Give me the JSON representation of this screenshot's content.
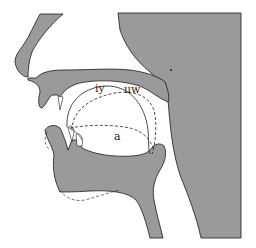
{
  "figure": {
    "colors": {
      "tissue_fill": "#9a9a9a",
      "outline": "#1a1a1a",
      "background": "#ffffff"
    }
  },
  "labels": {
    "vowel_iy": "iy",
    "vowel_uw": "uw",
    "vowel_a": "a"
  },
  "tongue_contours": [
    {
      "vowel": "iy",
      "line_style": "solid"
    },
    {
      "vowel": "uw",
      "line_style": "dashed"
    },
    {
      "vowel": "a",
      "line_style": "dashed"
    }
  ]
}
